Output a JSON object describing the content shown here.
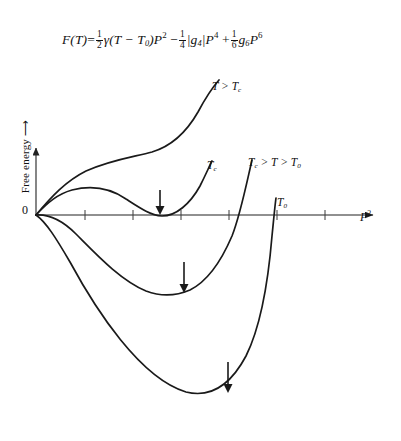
{
  "figure": {
    "type": "line",
    "equation": {
      "lhs": "F(T)",
      "eq": "=",
      "term1_coeff_num": "1",
      "term1_coeff_den": "2",
      "term1_body": "γ(T − T",
      "term1_sub": "0",
      "term1_tail": ")P",
      "term1_pow": "2",
      "minus": "−",
      "term2_coeff_num": "1",
      "term2_coeff_den": "4",
      "term2_body": "|g",
      "term2_sub": "4",
      "term2_tail": "|P",
      "term2_pow": "4",
      "plus": "+",
      "term3_coeff_num": "1",
      "term3_coeff_den": "6",
      "term3_body": "g",
      "term3_sub": "6",
      "term3_tail": "P",
      "term3_pow": "6"
    },
    "axes": {
      "ylabel": "Free energy ⟶",
      "xlabel_base": "P",
      "xlabel_exp": "2",
      "origin_label": "0",
      "x_tick_positions": [
        85,
        133,
        181,
        229,
        277,
        325
      ],
      "tick_length": 9
    },
    "curve_labels": [
      {
        "id": "t-gt-tc",
        "base": "T > T",
        "sub": "c",
        "x": 212,
        "y": 80
      },
      {
        "id": "tc",
        "base": "T",
        "sub": "c",
        "x": 207,
        "y": 159
      },
      {
        "id": "tc-gt-t-gt-t0",
        "base": "T",
        "sub": "c",
        "mid": " > T > T",
        "sub2": "0",
        "x": 248,
        "y": 156
      },
      {
        "id": "t0",
        "base": "T",
        "sub": "0",
        "x": 277,
        "y": 196
      }
    ],
    "minima_arrows": [
      {
        "id": "minimum-arrow-tc",
        "x": 160,
        "y_top": 190,
        "y_tip": 214
      },
      {
        "id": "minimum-arrow-intermediate",
        "x": 184,
        "y_top": 262,
        "y_tip": 292
      },
      {
        "id": "minimum-arrow-t0",
        "x": 228,
        "y_top": 362,
        "y_tip": 392
      }
    ],
    "curves": {
      "t_gt_tc": "M 36,215 C 52,196 66,181 86,171 C 110,160 133,157 152,152 C 172,146 186,133 198,112 C 206,97 212,88 219,80",
      "tc": "M 36,215 C 48,202 58,194 72,190 C 92,185 110,188 126,199 C 140,208 150,215 162,216 C 176,216 190,204 200,186 C 206,174 209,167 212,161",
      "tc_gt_t_gt_t0": "M 36,215 C 50,214 62,220 76,234 C 96,254 120,280 146,291 C 162,297 176,296 190,290 C 206,282 220,264 232,236 C 240,216 246,186 252,160",
      "t0": "M 36,215 C 46,222 56,238 70,262 C 96,310 140,378 186,392 C 210,398 230,386 246,356 C 260,328 268,284 272,236 C 274,216 275,205 276,198"
    },
    "style": {
      "curve_color": "#1a1a1a",
      "axis_color": "#222222",
      "curve_width": 1.7,
      "axis_width": 1.1
    }
  }
}
